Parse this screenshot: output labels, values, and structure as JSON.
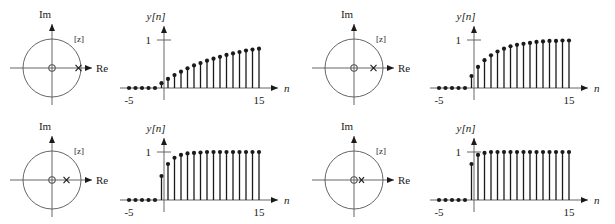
{
  "figure": {
    "title": "",
    "panels": [
      {
        "id": "panel-1",
        "position": "top-left",
        "zplane": {
          "im_label": "Im",
          "re_label": "Re",
          "region_label": "[z]",
          "unit_circle_radius": 1,
          "pole": {
            "symbol": "x",
            "real": 0.9,
            "imag": 0
          },
          "zero": {
            "symbol": "o",
            "real": 0,
            "imag": 0
          }
        },
        "response": {
          "ylabel": "y[n]",
          "xlabel": "n",
          "ytick_label": "1",
          "xtick_min_label": "-5",
          "xtick_max_label": "15"
        }
      },
      {
        "id": "panel-2",
        "position": "top-right",
        "zplane": {
          "im_label": "Im",
          "re_label": "Re",
          "region_label": "[z]",
          "unit_circle_radius": 1,
          "pole": {
            "symbol": "x",
            "real": 0.75,
            "imag": 0
          },
          "zero": {
            "symbol": "o",
            "real": 0,
            "imag": 0
          }
        },
        "response": {
          "ylabel": "y[n]",
          "xlabel": "n",
          "ytick_label": "1",
          "xtick_min_label": "-5",
          "xtick_max_label": "15"
        }
      },
      {
        "id": "panel-3",
        "position": "bottom-left",
        "zplane": {
          "im_label": "Im",
          "re_label": "Re",
          "region_label": "[z]",
          "unit_circle_radius": 1,
          "pole": {
            "symbol": "x",
            "real": 0.5,
            "imag": 0
          },
          "zero": {
            "symbol": "o",
            "real": 0,
            "imag": 0
          }
        },
        "response": {
          "ylabel": "y[n]",
          "xlabel": "n",
          "ytick_label": "1",
          "xtick_min_label": "-5",
          "xtick_max_label": "15"
        }
      },
      {
        "id": "panel-4",
        "position": "bottom-right",
        "zplane": {
          "im_label": "Im",
          "re_label": "Re",
          "region_label": "[z]",
          "unit_circle_radius": 1,
          "pole": {
            "symbol": "x",
            "real": 0.25,
            "imag": 0
          },
          "zero": {
            "symbol": "o",
            "real": 0,
            "imag": 0
          }
        },
        "response": {
          "ylabel": "y[n]",
          "xlabel": "n",
          "ytick_label": "1",
          "xtick_min_label": "-5",
          "xtick_max_label": "15"
        }
      }
    ]
  },
  "chart_data": [
    {
      "type": "scatter",
      "subtype": "pole-zero-plot",
      "title": "",
      "xlabel": "Re",
      "ylabel": "Im",
      "annotations": [
        "[z]"
      ],
      "xlim": [
        -1.45,
        1.45
      ],
      "ylim": [
        -1.45,
        1.45
      ],
      "grid": false,
      "legend": "none",
      "unit_circle": {
        "center": [
          0,
          0
        ],
        "radius": 1
      },
      "poles": [
        [
          0.9,
          0
        ]
      ],
      "zeros": [
        [
          0,
          0
        ]
      ]
    },
    {
      "type": "bar",
      "subtype": "stem",
      "title": "",
      "xlabel": "n",
      "ylabel": "y[n]",
      "xlim": [
        -6,
        16.5
      ],
      "ylim": [
        0,
        1.18
      ],
      "grid": false,
      "legend": "none",
      "ytick_values": [
        1
      ],
      "ytick_labels": [
        "1"
      ],
      "xtick_values": [
        -5,
        15
      ],
      "xtick_labels": [
        "-5",
        "15"
      ],
      "categories": [
        -5,
        -4,
        -3,
        -2,
        -1,
        0,
        1,
        2,
        3,
        4,
        5,
        6,
        7,
        8,
        9,
        10,
        11,
        12,
        13,
        14,
        15
      ],
      "values": [
        0,
        0,
        0,
        0,
        0,
        0.1,
        0.19,
        0.27,
        0.34,
        0.41,
        0.47,
        0.52,
        0.57,
        0.61,
        0.65,
        0.69,
        0.72,
        0.75,
        0.78,
        0.8,
        0.82
      ]
    },
    {
      "type": "scatter",
      "subtype": "pole-zero-plot",
      "title": "",
      "xlabel": "Re",
      "ylabel": "Im",
      "annotations": [
        "[z]"
      ],
      "xlim": [
        -1.45,
        1.45
      ],
      "ylim": [
        -1.45,
        1.45
      ],
      "grid": false,
      "legend": "none",
      "unit_circle": {
        "center": [
          0,
          0
        ],
        "radius": 1
      },
      "poles": [
        [
          0.75,
          0
        ]
      ],
      "zeros": [
        [
          0,
          0
        ]
      ]
    },
    {
      "type": "bar",
      "subtype": "stem",
      "title": "",
      "xlabel": "n",
      "ylabel": "y[n]",
      "xlim": [
        -6,
        16.5
      ],
      "ylim": [
        0,
        1.18
      ],
      "grid": false,
      "legend": "none",
      "ytick_values": [
        1
      ],
      "ytick_labels": [
        "1"
      ],
      "xtick_values": [
        -5,
        15
      ],
      "xtick_labels": [
        "-5",
        "15"
      ],
      "categories": [
        -5,
        -4,
        -3,
        -2,
        -1,
        0,
        1,
        2,
        3,
        4,
        5,
        6,
        7,
        8,
        9,
        10,
        11,
        12,
        13,
        14,
        15
      ],
      "values": [
        0,
        0,
        0,
        0,
        0,
        0.25,
        0.44,
        0.58,
        0.68,
        0.76,
        0.82,
        0.87,
        0.9,
        0.92,
        0.94,
        0.96,
        0.97,
        0.98,
        0.98,
        0.99,
        0.99
      ]
    },
    {
      "type": "scatter",
      "subtype": "pole-zero-plot",
      "title": "",
      "xlabel": "Re",
      "ylabel": "Im",
      "annotations": [
        "[z]"
      ],
      "xlim": [
        -1.45,
        1.45
      ],
      "ylim": [
        -1.45,
        1.45
      ],
      "grid": false,
      "legend": "none",
      "unit_circle": {
        "center": [
          0,
          0
        ],
        "radius": 1
      },
      "poles": [
        [
          0.5,
          0
        ]
      ],
      "zeros": [
        [
          0,
          0
        ]
      ]
    },
    {
      "type": "bar",
      "subtype": "stem",
      "title": "",
      "xlabel": "n",
      "ylabel": "y[n]",
      "xlim": [
        -6,
        16.5
      ],
      "ylim": [
        0,
        1.18
      ],
      "grid": false,
      "legend": "none",
      "ytick_values": [
        1
      ],
      "ytick_labels": [
        "1"
      ],
      "xtick_values": [
        -5,
        15
      ],
      "xtick_labels": [
        "-5",
        "15"
      ],
      "categories": [
        -5,
        -4,
        -3,
        -2,
        -1,
        0,
        1,
        2,
        3,
        4,
        5,
        6,
        7,
        8,
        9,
        10,
        11,
        12,
        13,
        14,
        15
      ],
      "values": [
        0,
        0,
        0,
        0,
        0,
        0.5,
        0.75,
        0.88,
        0.94,
        0.97,
        0.98,
        0.99,
        1,
        1,
        1,
        1,
        1,
        1,
        1,
        1,
        1
      ]
    },
    {
      "type": "scatter",
      "subtype": "pole-zero-plot",
      "title": "",
      "xlabel": "Re",
      "ylabel": "Im",
      "annotations": [
        "[z]"
      ],
      "xlim": [
        -1.45,
        1.45
      ],
      "ylim": [
        -1.45,
        1.45
      ],
      "grid": false,
      "legend": "none",
      "unit_circle": {
        "center": [
          0,
          0
        ],
        "radius": 1
      },
      "poles": [
        [
          0.25,
          0
        ]
      ],
      "zeros": [
        [
          0,
          0
        ]
      ]
    },
    {
      "type": "bar",
      "subtype": "stem",
      "title": "",
      "xlabel": "n",
      "ylabel": "y[n]",
      "xlim": [
        -6,
        16.5
      ],
      "ylim": [
        0,
        1.18
      ],
      "grid": false,
      "legend": "none",
      "ytick_values": [
        1
      ],
      "ytick_labels": [
        "1"
      ],
      "xtick_values": [
        -5,
        15
      ],
      "xtick_labels": [
        "-5",
        "15"
      ],
      "categories": [
        -5,
        -4,
        -3,
        -2,
        -1,
        0,
        1,
        2,
        3,
        4,
        5,
        6,
        7,
        8,
        9,
        10,
        11,
        12,
        13,
        14,
        15
      ],
      "values": [
        0,
        0,
        0,
        0,
        0,
        0.75,
        0.94,
        0.98,
        1,
        1,
        1,
        1,
        1,
        1,
        1,
        1,
        1,
        1,
        1,
        1,
        1
      ]
    }
  ]
}
